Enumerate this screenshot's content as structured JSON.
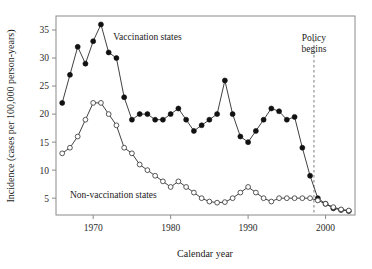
{
  "chart_data": {
    "type": "line",
    "title": "",
    "xlabel": "Calendar year",
    "ylabel": "Incidence (cases per 100,000 person-years)",
    "xlim": [
      1965.2,
      2003.8
    ],
    "ylim": [
      2.0,
      37.5
    ],
    "xticks": [
      1970,
      1980,
      1990,
      2000
    ],
    "xticklabels": [
      "1970",
      "1980",
      "1990",
      "2000"
    ],
    "yticks": [
      5,
      10,
      15,
      20,
      25,
      30,
      35
    ],
    "yticklabels": [
      "5",
      "10",
      "15",
      "20",
      "25",
      "30",
      "35"
    ],
    "grid": false,
    "legend_position": "inline-annotations",
    "series": [
      {
        "name": "Vaccination states",
        "marker": "filled-circle",
        "label_x": 1972.6,
        "label_y": 33.2,
        "x": [
          1966,
          1967,
          1968,
          1969,
          1970,
          1971,
          1972,
          1973,
          1974,
          1975,
          1976,
          1977,
          1978,
          1979,
          1980,
          1981,
          1982,
          1983,
          1984,
          1985,
          1986,
          1987,
          1988,
          1989,
          1990,
          1991,
          1992,
          1993,
          1994,
          1995,
          1996,
          1997,
          1998,
          1999,
          2000,
          2001,
          2002,
          2003
        ],
        "values": [
          22,
          27,
          32,
          29,
          33,
          36,
          31,
          30,
          23,
          19,
          20,
          20,
          19,
          19,
          20,
          21,
          19,
          17,
          18,
          19,
          20,
          26,
          20,
          16,
          15,
          17,
          19,
          21,
          20.5,
          19,
          19.5,
          14,
          9,
          5,
          4,
          3.2,
          2.9,
          2.7
        ]
      },
      {
        "name": "Non-vaccination states",
        "marker": "open-circle",
        "label_x": 1967.0,
        "label_y": 5.0,
        "x": [
          1966,
          1967,
          1968,
          1969,
          1970,
          1971,
          1972,
          1973,
          1974,
          1975,
          1976,
          1977,
          1978,
          1979,
          1980,
          1981,
          1982,
          1983,
          1984,
          1985,
          1986,
          1987,
          1988,
          1989,
          1990,
          1991,
          1992,
          1993,
          1994,
          1995,
          1996,
          1997,
          1998,
          1999,
          2000,
          2001,
          2002,
          2003
        ],
        "values": [
          13,
          14,
          16,
          19,
          22,
          22,
          20,
          18,
          14,
          13,
          11,
          10,
          9,
          8,
          7,
          8,
          7,
          6,
          5,
          4.4,
          4.2,
          4.3,
          5,
          6,
          7,
          6,
          5,
          4.4,
          5,
          5,
          5,
          5,
          5,
          4.6,
          4,
          3.4,
          3,
          2.8
        ]
      }
    ],
    "annotations": [
      {
        "name": "policy-begins",
        "text_line1": "Policy",
        "text_line2": "begins",
        "x": 1998.5,
        "label_y": 33.0
      }
    ],
    "colors": {
      "axis": "#8a8a8a",
      "line": "#2b2b2b",
      "filled_marker": "#111111",
      "open_marker_fill": "#ffffff",
      "open_marker_stroke": "#444444",
      "policy_line": "#9a9a9a",
      "text": "#1a1a1a",
      "background": "#ffffff"
    }
  }
}
